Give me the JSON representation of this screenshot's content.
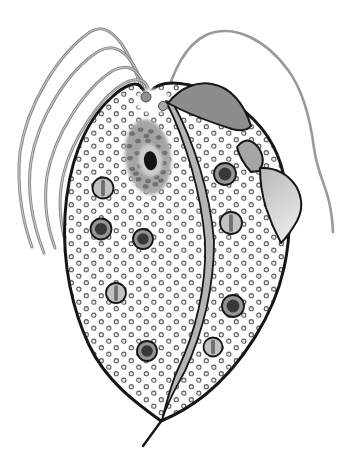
{
  "figure": {
    "kind": "biological-illustration",
    "canvas": {
      "width": 353,
      "height": 472,
      "background": "#ffffff"
    },
    "colors": {
      "outline": "#161616",
      "flagellum": "#8a8a8a",
      "flagellum_core": "#d9d9d9",
      "recurrent_flagellum": "#9a9a9a",
      "stipple_ring": "#5f5f5f",
      "stipple_center": "#ededed",
      "body_fill": "#ffffff",
      "vestibule": "#ffffff",
      "fin_dark": "#8d8d8d",
      "fin_mid": "#a6a6a6",
      "fin_light_top": "#b9b9b9",
      "fin_light_bottom": "#e7e7e7",
      "axostyle_band": "#b5b5b5",
      "nucleus_mid": "#a0a0a0",
      "nucleus_light": "#c6c6c6",
      "nucleus_spot": "#6a6a6a",
      "karyosome_halo": "#cccccc",
      "karyosome": "#141414",
      "granule_ring": "#949494",
      "granule_core": "#383838",
      "striped_fill": "#c2c2c2",
      "striped_slit": "#6e6e6e",
      "basal_body": "#8f8f8f",
      "basal_body2": "#a8a8a8"
    },
    "stipple": {
      "tile_w": 15,
      "tile_h": 13,
      "r": 2.1,
      "ring_w": 1.1,
      "dots": [
        [
          3.8,
          3.2
        ],
        [
          11.3,
          9.7
        ]
      ]
    },
    "body": {
      "outline_path": "M161,421 C135,402 106,381 89,345 C73,311 62,265 65,215 C68,168 82,124 112,97 C124,86 135,81 140,86 C144,90 145,93 147,96 C150,93 153,87 160,85 C172,80 200,84 228,100 C252,114 272,136 281,165 C290,196 292,232 284,268 C274,314 243,364 205,395 C190,407 173,416 161,421 Z",
      "stroke_width": 3
    },
    "vestibule": {
      "cx": 153,
      "cy": 101,
      "rx": 17,
      "ry": 12
    },
    "anterior_flagella": [
      {
        "path": "M143,94 C128,42 108,20 90,32 C58,54 27,105 20,152 C16,190 24,226 32,247"
      },
      {
        "path": "M145,95 C136,58 118,40 99,51 C68,70 38,118 31,161 C26,196 35,230 44,253"
      },
      {
        "path": "M147,97 C143,72 131,62 114,70 C84,88 54,136 47,176 C43,206 48,228 55,248"
      },
      {
        "path": "M149,98 C150,82 141,76 127,82 C101,94 71,141 63,176 C58,200 60,218 64,237"
      }
    ],
    "recurrent_flagellum": {
      "path": "M164,103 C174,68 186,45 206,35 C234,23 266,40 288,70 C302,89 310,117 314,148 C318,180 331,188 333,232"
    },
    "undulating_membrane": [
      {
        "name": "wave-1-dark",
        "path": "M168,103 C180,88 196,81 212,84 C230,87 244,103 251,126 C247,131 240,131 232,129 C210,122 186,113 168,103 Z",
        "fill_key": "fin_dark"
      },
      {
        "name": "wave-2-mid",
        "path": "M237,147 Q247,134 258,147 Q267,160 259,171 L251,172 Q240,160 237,147 Z",
        "fill_key": "fin_mid"
      },
      {
        "name": "wave-3-light",
        "path": "M260,168 Q283,167 296,186 Q306,204 297,221 Q289,235 281,243 Q272,226 266,208 Q260,188 260,168 Z",
        "fill_key": "fin_light"
      }
    ],
    "axostyle": {
      "band_path": "M166,101 C186,142 201,192 205,241 C207,287 195,333 178,369 C172,382 166,404 162,420 C168,400 177,386 185,371 C202,334 214,288 214,241 C210,192 194,142 173,103 Z",
      "spike": {
        "x1": 162,
        "y1": 420,
        "x2": 143,
        "y2": 446
      }
    },
    "nucleus": {
      "cx": 148,
      "cy": 157,
      "rx": 23,
      "ry": 38,
      "rotate": -7,
      "halo": {
        "cx": 150,
        "cy": 161,
        "rx": 12,
        "ry": 16
      },
      "karyosome": {
        "cx": 150,
        "cy": 161,
        "rx": 6.5,
        "ry": 9.5
      },
      "spot_rx": 2.9,
      "spot_ry": 2.2,
      "spots": [
        [
          -13,
          -25
        ],
        [
          -4,
          -28
        ],
        [
          6,
          -25
        ],
        [
          13,
          -18
        ],
        [
          -17,
          -13
        ],
        [
          -8,
          -17
        ],
        [
          2,
          -16
        ],
        [
          11,
          -9
        ],
        [
          17,
          -2
        ],
        [
          -18,
          -1
        ],
        [
          -10,
          -5
        ],
        [
          -17,
          10
        ],
        [
          -9,
          8
        ],
        [
          -2,
          13
        ],
        [
          8,
          11
        ],
        [
          15,
          8
        ],
        [
          -12,
          21
        ],
        [
          -3,
          24
        ],
        [
          6,
          21
        ],
        [
          13,
          17
        ],
        [
          1,
          -21
        ],
        [
          -14,
          15
        ],
        [
          4,
          28
        ],
        [
          -6,
          29
        ],
        [
          10,
          25
        ]
      ]
    },
    "dark_granules": [
      {
        "cx": 101,
        "cy": 229,
        "r": 10.5
      },
      {
        "cx": 143,
        "cy": 239,
        "r": 10
      },
      {
        "cx": 225,
        "cy": 174,
        "r": 11
      },
      {
        "cx": 233,
        "cy": 306,
        "r": 11
      },
      {
        "cx": 147,
        "cy": 351,
        "r": 10
      }
    ],
    "striped_granules": [
      {
        "cx": 103,
        "cy": 188,
        "r": 10.5
      },
      {
        "cx": 116,
        "cy": 293,
        "r": 10
      },
      {
        "cx": 231,
        "cy": 223,
        "r": 11
      },
      {
        "cx": 213,
        "cy": 347,
        "r": 9.5
      }
    ],
    "basal_bodies": [
      {
        "cx": 146,
        "cy": 97,
        "r": 5,
        "fill_key": "basal_body"
      },
      {
        "cx": 163,
        "cy": 106,
        "r": 4.5,
        "fill_key": "basal_body2"
      }
    ]
  }
}
